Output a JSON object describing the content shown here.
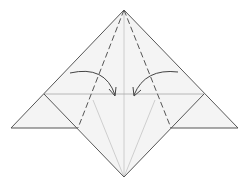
{
  "diagram": {
    "type": "origami-fold-step",
    "colors": {
      "background": "#ffffff",
      "paper": "#f4f4f4",
      "outline": "#555555",
      "crease": "#bcbcbc",
      "valley_fold": "#555555",
      "arrow": "#444444"
    },
    "arrows": [
      {
        "name": "fold-arrow-left",
        "direction": "right"
      },
      {
        "name": "fold-arrow-right",
        "direction": "left"
      }
    ],
    "fold_lines": [
      {
        "name": "valley-fold-left",
        "style": "dashed"
      },
      {
        "name": "valley-fold-right",
        "style": "dashed"
      }
    ]
  }
}
